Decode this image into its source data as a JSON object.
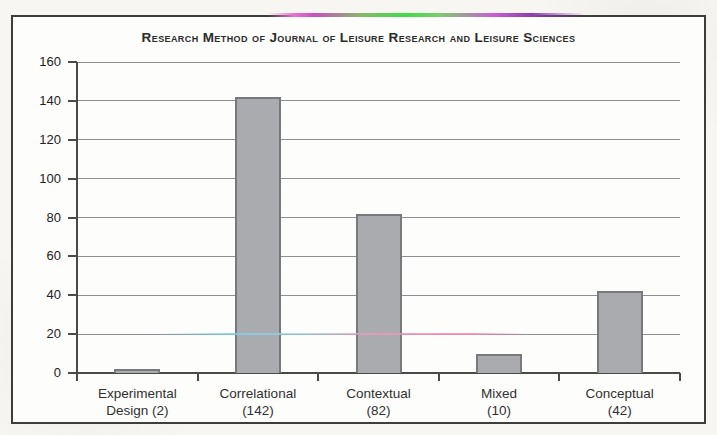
{
  "page": {
    "background_color": "#f7f6f2",
    "frame_border_color": "#3d3d3d"
  },
  "chart_data": {
    "type": "bar",
    "title": "Research Method of Journal of Leisure Research and Leisure Sciences",
    "categories": [
      "Experimental Design (2)",
      "Correlational (142)",
      "Contextual (82)",
      "Mixed (10)",
      "Conceptual (42)"
    ],
    "category_label_lines": [
      [
        "Experimental",
        "Design (2)"
      ],
      [
        "Correlational",
        "(142)"
      ],
      [
        "Contextual",
        "(82)"
      ],
      [
        "Mixed",
        "(10)"
      ],
      [
        "Conceptual",
        "(42)"
      ]
    ],
    "values": [
      2,
      142,
      82,
      10,
      42
    ],
    "xlabel": "",
    "ylabel": "",
    "ylim": [
      0,
      160
    ],
    "yticks": [
      0,
      20,
      40,
      60,
      80,
      100,
      120,
      140,
      160
    ],
    "grid": true,
    "legend": "none",
    "bar_color": "#a9abae",
    "bar_border_color": "#78797c",
    "gridline_color": "#8d8f91",
    "axis_color": "#4a4a4a",
    "title_color": "#2b2b2b",
    "label_color": "#303030"
  },
  "artifacts": {
    "top_scan_line_colors": [
      "#e873cf",
      "#3fdc4c",
      "#8d3fae"
    ],
    "gridline20_tint_colors": [
      "#82cdeb",
      "#f28cb4"
    ]
  }
}
